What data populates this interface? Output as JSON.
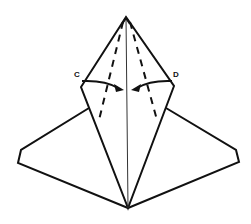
{
  "diagram": {
    "type": "origami-fold-step",
    "labels": {
      "left_corner": "C",
      "right_corner": "D"
    },
    "colors": {
      "line": "#111111",
      "background": "#ffffff"
    },
    "instructions": "Fold corners C and D toward the center crease along the dashed lines"
  }
}
